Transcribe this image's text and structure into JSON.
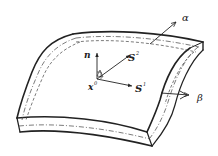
{
  "diagram": {
    "labels": {
      "normal": "n",
      "s2_base": "S",
      "s2_sup": "2",
      "s1_base": "S",
      "s1_sup": "1",
      "origin_base": "x",
      "origin_sup": "0",
      "alpha": "α",
      "beta": "β"
    },
    "colors": {
      "stroke": "#222222",
      "background": "#ffffff"
    }
  }
}
